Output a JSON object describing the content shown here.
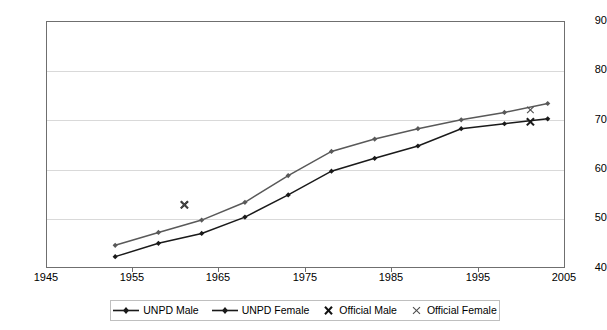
{
  "chart_data": {
    "type": "line",
    "title": "",
    "xlabel": "",
    "ylabel": "",
    "xlim": [
      1945,
      2005
    ],
    "ylim": [
      40,
      90
    ],
    "xticks": [
      1945,
      1955,
      1965,
      1975,
      1985,
      1995,
      2005
    ],
    "yticks": [
      40,
      50,
      60,
      70,
      80,
      90
    ],
    "grid": "horizontal",
    "legend_position": "bottom",
    "series": [
      {
        "name": "UNPD Male",
        "type": "line",
        "color": "#1a1a1a",
        "marker": "diamond",
        "x": [
          1953,
          1958,
          1963,
          1968,
          1973,
          1978,
          1983,
          1988,
          1993,
          1998,
          2003
        ],
        "values": [
          42.3,
          45.0,
          47.0,
          50.3,
          54.8,
          59.6,
          62.2,
          64.7,
          68.2,
          69.2,
          70.2
        ]
      },
      {
        "name": "UNPD Female",
        "type": "line",
        "color": "#595959",
        "marker": "diamond",
        "x": [
          1953,
          1958,
          1963,
          1968,
          1973,
          1978,
          1983,
          1988,
          1993,
          1998,
          2003
        ],
        "values": [
          44.6,
          47.2,
          49.7,
          53.3,
          58.7,
          63.6,
          66.1,
          68.2,
          70.0,
          71.5,
          73.3
        ]
      },
      {
        "name": "Official Male",
        "type": "scatter",
        "color": "#1a1a1a",
        "marker": "x-bold",
        "x": [
          1961,
          2001
        ],
        "values": [
          52.8,
          69.6
        ]
      },
      {
        "name": "Official Female",
        "type": "scatter",
        "color": "#4d4d4d",
        "marker": "x-thin",
        "x": [
          1961,
          2001
        ],
        "values": [
          52.8,
          72.0
        ]
      }
    ]
  },
  "axes": {
    "y_labels": [
      "90",
      "80",
      "70",
      "60",
      "50",
      "40"
    ],
    "x_labels": [
      "1945",
      "1955",
      "1965",
      "1975",
      "1985",
      "1995",
      "2005"
    ]
  },
  "legend": {
    "items": [
      {
        "label": "UNPD Male",
        "key": "line-diamond-dark"
      },
      {
        "label": "UNPD Female",
        "key": "line-diamond-gray"
      },
      {
        "label": "Official Male",
        "key": "x-marker-bold"
      },
      {
        "label": "Official Female",
        "key": "x-marker-thin"
      }
    ]
  }
}
